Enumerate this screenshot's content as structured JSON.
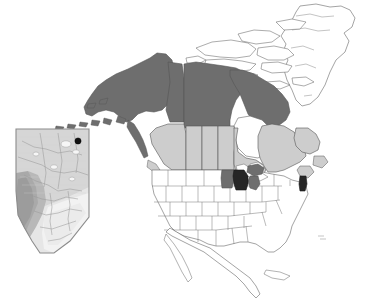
{
  "figure": {
    "kind": "choropleth-map",
    "title": "",
    "region": "North America",
    "background_color": "#ffffff",
    "outline_color": "#555555"
  },
  "legend_colors": {
    "highlight_dark": "#262626",
    "shade_dark_gray": "#6e6e6e",
    "shade_light_gray": "#cdcdcd",
    "shade_white": "#ffffff",
    "marker_dot": "#111111",
    "inset_terrain_light": "#e3e3e3",
    "inset_terrain_mid": "#c8c8c8",
    "inset_terrain_dark": "#a8a8a8",
    "inset_border": "#8c8c8c"
  },
  "regions": [
    {
      "name": "Alaska",
      "country": "United States",
      "shade": "dark-gray",
      "fill": "#6e6e6e"
    },
    {
      "name": "Yukon",
      "country": "Canada",
      "shade": "dark-gray",
      "fill": "#6e6e6e"
    },
    {
      "name": "Northwest Territories",
      "country": "Canada",
      "shade": "dark-gray",
      "fill": "#6e6e6e"
    },
    {
      "name": "Nunavut",
      "country": "Canada",
      "shade": "dark-gray",
      "fill": "#6e6e6e"
    },
    {
      "name": "British Columbia",
      "country": "Canada",
      "shade": "light-gray",
      "fill": "#cdcdcd"
    },
    {
      "name": "Alberta",
      "country": "Canada",
      "shade": "light-gray",
      "fill": "#cdcdcd"
    },
    {
      "name": "Saskatchewan",
      "country": "Canada",
      "shade": "light-gray",
      "fill": "#cdcdcd"
    },
    {
      "name": "Manitoba",
      "country": "Canada",
      "shade": "light-gray",
      "fill": "#cdcdcd"
    },
    {
      "name": "Ontario",
      "country": "Canada",
      "shade": "light-gray",
      "fill": "#cdcdcd"
    },
    {
      "name": "Quebec",
      "country": "Canada",
      "shade": "light-gray",
      "fill": "#cdcdcd"
    },
    {
      "name": "Atlantic Canada",
      "country": "Canada",
      "shade": "light-gray",
      "fill": "#cdcdcd"
    },
    {
      "name": "Minnesota",
      "country": "United States",
      "shade": "dark-gray",
      "fill": "#6e6e6e"
    },
    {
      "name": "Michigan",
      "country": "United States",
      "shade": "dark-gray",
      "fill": "#6e6e6e"
    },
    {
      "name": "Wisconsin",
      "country": "United States",
      "shade": "highlight",
      "fill": "#262626"
    },
    {
      "name": "New Hampshire",
      "country": "United States",
      "shade": "highlight",
      "fill": "#262626"
    },
    {
      "name": "Contiguous United States",
      "country": "United States",
      "shade": "white",
      "fill": "#ffffff"
    },
    {
      "name": "Greenland",
      "country": "Denmark",
      "shade": "white",
      "fill": "#ffffff"
    },
    {
      "name": "Mexico",
      "country": "Mexico",
      "shade": "white",
      "fill": "#ffffff"
    },
    {
      "name": "Cuba",
      "country": "Cuba",
      "shade": "white",
      "fill": "#ffffff"
    }
  ],
  "inset": {
    "name": "Alberta",
    "label": "",
    "marker": {
      "name": "study-site",
      "label": "",
      "x": 64,
      "y": 14
    }
  }
}
